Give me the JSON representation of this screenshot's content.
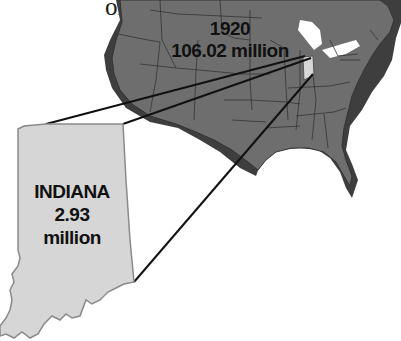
{
  "text_lines": [
    "on to",
    "ion.",
    "diana."
  ],
  "us_map": {
    "year": "1920",
    "population": "106.02 million",
    "fill_color": "#6b6b6b",
    "shadow_color": "#3e3e3e",
    "border_color": "#2e2e2e"
  },
  "indiana_inset": {
    "name": "INDIANA",
    "population_value": "2.93",
    "population_unit": "million",
    "fill_color": "#d6d6d6",
    "border_color": "#8a8a8a"
  },
  "connector_color": "#111111"
}
